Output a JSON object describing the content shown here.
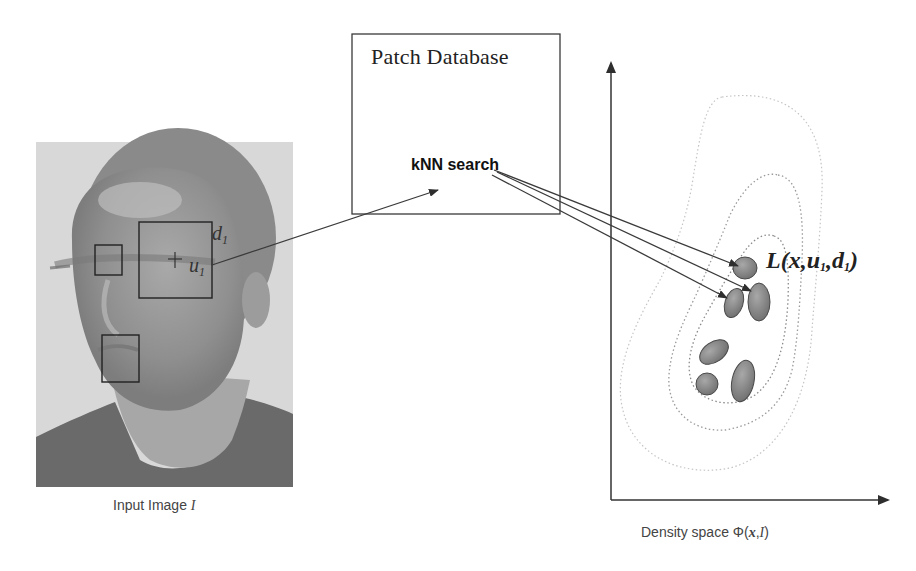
{
  "colors": {
    "line": "#3a3a3a",
    "ellipse_fill": "#8a8a8a",
    "ellipse_stroke": "#444444",
    "contour": "#9a9a9a",
    "face_bg": "#d6d6d6"
  },
  "database": {
    "title": "Patch Database",
    "search_label": "kNN search"
  },
  "input_image": {
    "caption_prefix": "Input Image ",
    "caption_symbol": "I",
    "patch_center_label": "u",
    "patch_center_sub": "1",
    "patch_size_label": "d",
    "patch_size_sub": "1"
  },
  "density": {
    "caption_prefix": "Density space Φ(",
    "caption_x": "x",
    "caption_sep": ",",
    "caption_I": "I",
    "caption_suffix": ")",
    "likelihood_label": {
      "L": "L(x,u",
      "sub1": "1",
      "mid": ",d",
      "sub2": "1",
      "end": ")"
    }
  },
  "icons": {
    "face": "face-photo",
    "arrow": "arrow-icon",
    "crosshair": "plus-icon"
  }
}
